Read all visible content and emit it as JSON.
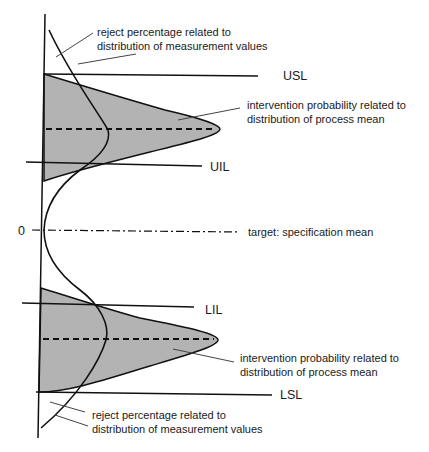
{
  "diagram": {
    "type": "control-limits-diagram",
    "colors": {
      "line": "#111111",
      "fill": "#b3b3b3",
      "leader": "#444444"
    },
    "limits": [
      {
        "id": "usl",
        "label": "USL"
      },
      {
        "id": "uil",
        "label": "UIL"
      },
      {
        "id": "target",
        "label": "target: specification mean",
        "axis_value": "0"
      },
      {
        "id": "lil",
        "label": "LIL"
      },
      {
        "id": "lsl",
        "label": "LSL"
      }
    ],
    "annotations": {
      "top_reject_line1": "reject percentage related to",
      "top_reject_line2": "distribution of measurement values",
      "upper_intervention_line1": "intervention probability related to",
      "upper_intervention_line2": "distribution of process mean",
      "lower_intervention_line1": "intervention probability related to",
      "lower_intervention_line2": "distribution of process mean",
      "bottom_reject_line1": "reject percentage related to",
      "bottom_reject_line2": "distribution of measurement values"
    }
  }
}
